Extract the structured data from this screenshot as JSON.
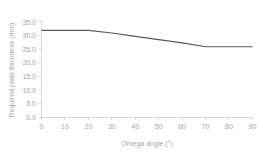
{
  "chart_data": {
    "type": "line",
    "title": "",
    "subtitle": "",
    "xlabel": "Omega angle (°)",
    "ylabel": "Required plate thickness (mm)",
    "xlim": [
      0,
      90
    ],
    "ylim": [
      0.0,
      35.0
    ],
    "grid": false,
    "legend": "none",
    "x_ticks": [
      "0",
      "10",
      "20",
      "30",
      "40",
      "50",
      "60",
      "70",
      "80",
      "90"
    ],
    "x_tick_values": [
      0,
      10,
      20,
      30,
      40,
      50,
      60,
      70,
      80,
      90
    ],
    "y_ticks": [
      "0.0",
      "5.0",
      "10.0",
      "15.0",
      "20.0",
      "25.0",
      "30.0",
      "35.0"
    ],
    "y_tick_values": [
      0.0,
      5.0,
      10.0,
      15.0,
      20.0,
      25.0,
      30.0,
      35.0
    ],
    "series": [
      {
        "name": "Required plate thickness",
        "color": "#595959",
        "x": [
          0,
          10,
          20,
          30,
          40,
          50,
          60,
          70,
          80,
          90
        ],
        "values": [
          31.8,
          31.8,
          31.8,
          30.8,
          29.6,
          28.4,
          27.2,
          25.8,
          25.8,
          25.8
        ]
      }
    ],
    "annotations": []
  },
  "style": {
    "line_color": "#595959",
    "axis_color": "#d9d9d9",
    "tick_label_color": "#a6a6a6",
    "background": "#ffffff"
  }
}
